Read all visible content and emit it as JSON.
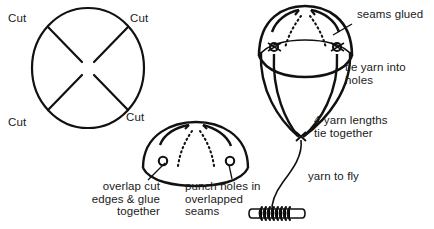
{
  "figure": {
    "stroke_color": "#111111",
    "text_color": "#1a1a1a",
    "background_color": "#ffffff",
    "panels": [
      {
        "name": "flat-circle-pattern",
        "description": "Circle with four diagonal cut lines radiating inward from the rim"
      },
      {
        "name": "glued-dome",
        "description": "Hemisphere formed by overlapping and gluing the cut edges, with punched holes in the overlapped seams"
      },
      {
        "name": "assembled-balloon",
        "description": "Two domes joined into a balloon with four yarn lengths tied into the holes, converging and tied together, yarn running to a spool"
      }
    ]
  },
  "labels": {
    "cut_top_left": "Cut",
    "cut_top_right": "Cut",
    "cut_bottom_left": "Cut",
    "cut_bottom_right": "Cut",
    "overlap_glue": "overlap cut\nedges & glue\ntogether",
    "punch_holes": "punch holes in\noverlapped\nseams",
    "seams_glued": "seams glued",
    "tie_yarn_holes": "tie yarn into\nholes",
    "four_yarn_lengths": "4 yarn lengths\ntie together",
    "yarn_to_fly": "yarn to fly"
  },
  "icons": {
    "hole_marker": "hole-circle-icon",
    "spool": "yarn-spool-icon",
    "arrowhead": "arrowhead-icon"
  },
  "colors": {
    "ink": "#111111",
    "paper": "#ffffff"
  }
}
